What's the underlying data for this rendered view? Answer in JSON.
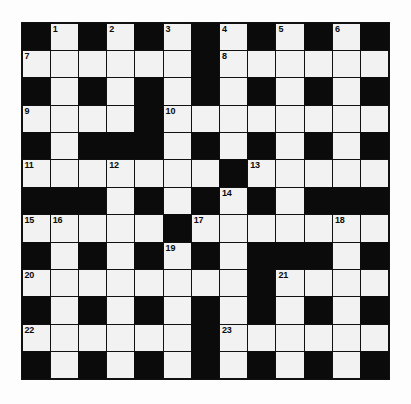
{
  "puzzle": {
    "type": "crossword-grid",
    "title": "Crossword Puzzle Grid",
    "rows": 13,
    "columns": 13,
    "colors": {
      "block": "#0b0b0b",
      "cell": "#f2f2f2",
      "grid_line": "#111111",
      "number_text": "#0b0b0b",
      "page_background": "#fdfdfd"
    },
    "highest_clue_number": 23,
    "clue_numbers_visible": [
      1,
      2,
      3,
      4,
      5,
      6,
      7,
      8,
      9,
      10,
      11,
      12,
      13,
      14,
      15,
      16,
      17,
      18,
      19,
      20,
      21,
      22,
      23
    ],
    "legend": {
      "1": "white open cell (fillable)",
      "0": "black blocked cell"
    },
    "grid": [
      [
        0,
        1,
        0,
        1,
        0,
        1,
        0,
        1,
        0,
        1,
        0,
        1,
        0
      ],
      [
        1,
        1,
        1,
        1,
        1,
        1,
        0,
        1,
        1,
        1,
        1,
        1,
        1
      ],
      [
        0,
        1,
        0,
        1,
        0,
        1,
        0,
        1,
        0,
        1,
        0,
        1,
        0
      ],
      [
        1,
        1,
        1,
        1,
        0,
        1,
        1,
        1,
        1,
        1,
        1,
        1,
        1
      ],
      [
        0,
        1,
        0,
        0,
        0,
        1,
        0,
        1,
        0,
        1,
        0,
        1,
        0
      ],
      [
        1,
        1,
        1,
        1,
        1,
        1,
        1,
        0,
        1,
        1,
        1,
        1,
        1
      ],
      [
        0,
        0,
        0,
        1,
        0,
        1,
        0,
        1,
        0,
        1,
        0,
        0,
        0
      ],
      [
        1,
        1,
        1,
        1,
        1,
        0,
        1,
        1,
        1,
        1,
        1,
        1,
        1
      ],
      [
        0,
        1,
        0,
        1,
        0,
        1,
        0,
        1,
        0,
        0,
        0,
        1,
        0
      ],
      [
        1,
        1,
        1,
        1,
        1,
        1,
        1,
        1,
        0,
        1,
        1,
        1,
        1
      ],
      [
        0,
        1,
        0,
        1,
        0,
        1,
        0,
        1,
        0,
        1,
        0,
        1,
        0
      ],
      [
        1,
        1,
        1,
        1,
        1,
        1,
        0,
        1,
        1,
        1,
        1,
        1,
        1
      ],
      [
        0,
        1,
        0,
        1,
        0,
        1,
        0,
        1,
        0,
        1,
        0,
        1,
        0
      ]
    ],
    "numbers": [
      {
        "row": 0,
        "col": 1,
        "label": "1"
      },
      {
        "row": 0,
        "col": 3,
        "label": "2"
      },
      {
        "row": 0,
        "col": 5,
        "label": "3"
      },
      {
        "row": 0,
        "col": 7,
        "label": "4"
      },
      {
        "row": 0,
        "col": 9,
        "label": "5"
      },
      {
        "row": 0,
        "col": 11,
        "label": "6"
      },
      {
        "row": 1,
        "col": 0,
        "label": "7"
      },
      {
        "row": 1,
        "col": 7,
        "label": "8"
      },
      {
        "row": 3,
        "col": 0,
        "label": "9"
      },
      {
        "row": 3,
        "col": 5,
        "label": "10"
      },
      {
        "row": 5,
        "col": 0,
        "label": "11"
      },
      {
        "row": 5,
        "col": 3,
        "label": "12"
      },
      {
        "row": 5,
        "col": 8,
        "label": "13"
      },
      {
        "row": 6,
        "col": 7,
        "label": "14"
      },
      {
        "row": 7,
        "col": 0,
        "label": "15"
      },
      {
        "row": 7,
        "col": 1,
        "label": "16"
      },
      {
        "row": 7,
        "col": 6,
        "label": "17"
      },
      {
        "row": 7,
        "col": 11,
        "label": "18"
      },
      {
        "row": 8,
        "col": 5,
        "label": "19"
      },
      {
        "row": 9,
        "col": 0,
        "label": "20"
      },
      {
        "row": 9,
        "col": 9,
        "label": "21"
      },
      {
        "row": 11,
        "col": 0,
        "label": "22"
      },
      {
        "row": 11,
        "col": 7,
        "label": "23"
      }
    ]
  }
}
